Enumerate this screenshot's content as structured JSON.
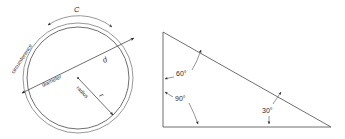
{
  "figure": {
    "background_color": "#ffffff",
    "line_color": "#4a4a4a",
    "text_color": "#2b2b2b"
  },
  "circle_diagram": {
    "name": "circle-figure",
    "labels": {
      "circumference": "circumference",
      "circumference_symbol": "C",
      "diameter": "diameter",
      "diameter_symbol": "d",
      "radius": "radius",
      "radius_symbol": "r"
    },
    "geometry": {
      "center_x": 78,
      "center_y": 78,
      "inner_radius": 51,
      "outer_radius": 55
    }
  },
  "triangle_diagram": {
    "name": "triangle-figure",
    "angles": [
      {
        "label": "60°",
        "vertex": "top-left"
      },
      {
        "label": "90°",
        "vertex": "bottom-left"
      },
      {
        "label": "30°",
        "vertex": "bottom-right"
      }
    ],
    "angle_top": "60°",
    "angle_left": "90°",
    "angle_right": "30°",
    "geometry": {
      "apex_x": 163,
      "apex_y": 32,
      "bottom_left_x": 163,
      "bottom_left_y": 127,
      "bottom_right_x": 331,
      "bottom_right_y": 127
    }
  }
}
